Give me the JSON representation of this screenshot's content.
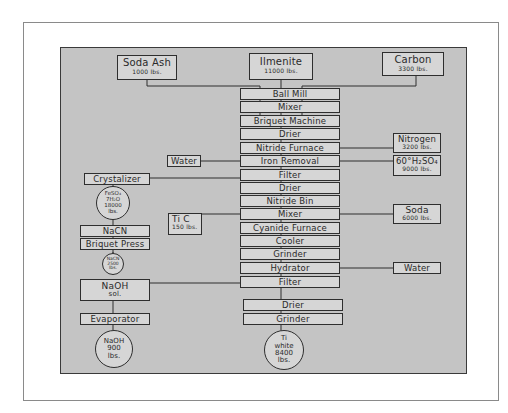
{
  "diagram": {
    "type": "process-flow",
    "inputs_top": [
      {
        "label": "Soda Ash",
        "qty": "1000 lbs."
      },
      {
        "label": "Ilmenite",
        "qty": "11000 lbs."
      },
      {
        "label": "Carbon",
        "qty": "3300 lbs."
      }
    ],
    "main_chain": [
      "Ball Mill",
      "Mixer",
      "Briquet Machine",
      "Drier",
      "Nitride Furnace",
      "Iron Removal",
      "Filter",
      "Drier",
      "Nitride Bin",
      "Mixer",
      "Cyanide Furnace",
      "Cooler",
      "Grinder",
      "Hydrator",
      "Filter",
      "Drier",
      "Grinder"
    ],
    "final_product": {
      "line1": "Ti",
      "line2": "white",
      "line3": "8400",
      "line4": "lbs."
    },
    "right_inputs": [
      {
        "label": "Nitrogen",
        "qty": "3200 lbs.",
        "to": "Nitride Furnace"
      },
      {
        "label": "60°H₂SO₄",
        "qty": "9000 lbs.",
        "to": "Iron Removal"
      },
      {
        "label": "Soda",
        "qty": "6000 lbs.",
        "to": "Mixer"
      },
      {
        "label": "Water",
        "qty": "",
        "to": "Hydrator"
      }
    ],
    "left_inputs": [
      {
        "label": "Water",
        "to": "Iron Removal"
      },
      {
        "label": "Ti C",
        "qty": "150 lbs.",
        "to": "Mixer"
      }
    ],
    "side_chain": {
      "crystalizer": "Crystalizer",
      "ferrous_product": {
        "line1": "FeSO₄",
        "line2": "7H₂O",
        "line3": "18000",
        "line4": "lbs."
      },
      "nacn": "NaCN",
      "briquet_press": "Briquet Press",
      "nacn_product": {
        "line1": "NaCN",
        "line2": "2500",
        "line3": "lbs."
      },
      "naoh_sol": {
        "line1": "NaOH",
        "line2": "sol."
      },
      "evaporator": "Evaporator",
      "naoh_product": {
        "line1": "NaOH",
        "line2": "900",
        "line3": "lbs."
      }
    },
    "colors": {
      "panel": "#c4c4c4",
      "box_fill": "#d6d6d6",
      "line": "#2e2e2e",
      "frame": "#8a8a8a"
    }
  }
}
